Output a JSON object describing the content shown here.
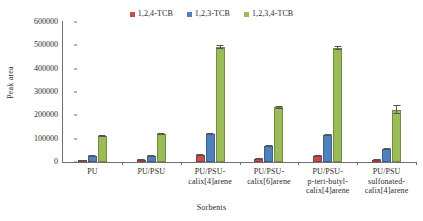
{
  "chart_data": {
    "type": "bar",
    "title": "",
    "xlabel": "Sorbents",
    "ylabel": "Peak area",
    "ylim": [
      0,
      600000
    ],
    "ytick_step": 100000,
    "yticks": [
      0,
      100000,
      200000,
      300000,
      400000,
      500000,
      600000
    ],
    "ytick_labels": [
      "0",
      "100000",
      "200000",
      "300000",
      "400000",
      "500000",
      "600000"
    ],
    "grid": false,
    "legend_position": "top-center",
    "error_bars": true,
    "categories": [
      "PU",
      "PU/PSU",
      "PU/PSU-calix[4]arene",
      "PU/PSU-calix[6]arene",
      "PU/PSU-p-tert-butyl-calix[4]arene",
      "PU/PSU sulfonated-calix[4]arene"
    ],
    "category_lines": [
      [
        "PU"
      ],
      [
        "PU/PSU"
      ],
      [
        "PU/PSU-",
        "calix[4]arene"
      ],
      [
        "PU/PSU-",
        "calix[6]arene"
      ],
      [
        "PU/PSU-",
        "p-tert-butyl-",
        "calix[4]arene"
      ],
      [
        "PU/PSU",
        "sulfonated-",
        "calix[4]arene"
      ]
    ],
    "series": [
      {
        "name": "1,2,4-TCB",
        "color": "#C0504D",
        "values": [
          8000,
          9000,
          30000,
          15000,
          27000,
          10000
        ],
        "errors": [
          2000,
          2000,
          3000,
          2000,
          3000,
          2000
        ]
      },
      {
        "name": "1,2,3-TCB",
        "color": "#4F81BD",
        "values": [
          25000,
          27000,
          119000,
          70000,
          115000,
          55000
        ],
        "errors": [
          3000,
          4000,
          5000,
          5000,
          5000,
          4000
        ]
      },
      {
        "name": "1,2,3,4-TCB",
        "color": "#9BBB59",
        "values": [
          112000,
          120000,
          492000,
          235000,
          488000,
          225000
        ],
        "errors": [
          5000,
          5000,
          8000,
          6000,
          10000,
          18000
        ]
      }
    ]
  },
  "legend": {
    "entries": [
      {
        "label": "1,2,4-TCB",
        "color": "#C0504D"
      },
      {
        "label": "1,2,3-TCB",
        "color": "#4F81BD"
      },
      {
        "label": "1,2,3,4-TCB",
        "color": "#9BBB59"
      }
    ]
  },
  "axes": {
    "y_title": "Peak area",
    "x_title": "Sorbents"
  }
}
